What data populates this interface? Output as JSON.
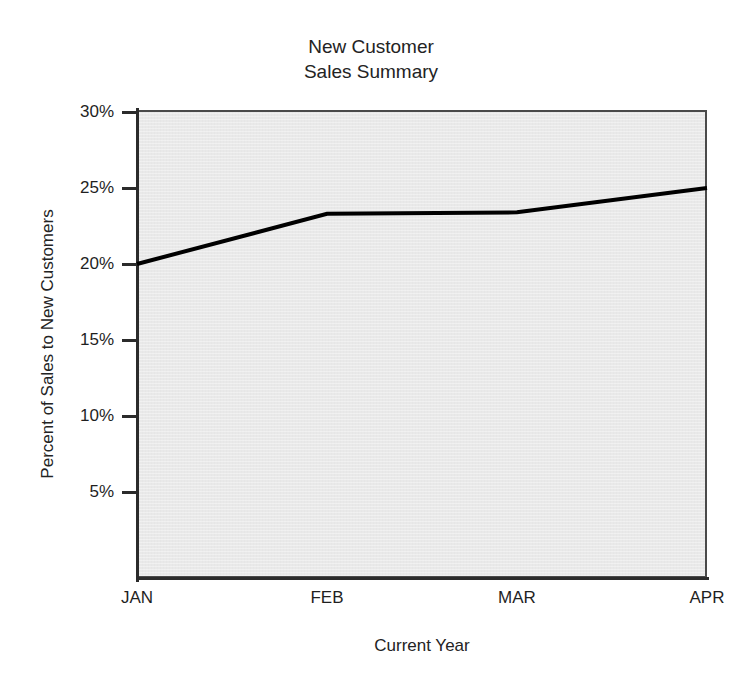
{
  "chart_data": {
    "type": "line",
    "title": "New Customer\nSales Summary",
    "title_lines": [
      "New Customer",
      "Sales Summary"
    ],
    "xlabel": "Current Year",
    "ylabel": "Percent of Sales to New Customers",
    "categories": [
      "JAN",
      "FEB",
      "MAR",
      "APR"
    ],
    "series": [
      {
        "name": "Percent of Sales to New Customers",
        "values": [
          20.0,
          23.3,
          23.4,
          25.0
        ],
        "color": "#000000",
        "line_width": 4
      }
    ],
    "ylim": [
      0,
      30
    ],
    "ytick_values": [
      30,
      25,
      20,
      15,
      10,
      5
    ],
    "ytick_labels": [
      "30%",
      "25%",
      "20%",
      "15%",
      "10%",
      "5%"
    ],
    "xtick_labels": [
      "JAN",
      "FEB",
      "MAR",
      "APR"
    ],
    "grid": false,
    "legend": false,
    "plot_background": "#e9e9e9",
    "axis_color": "#2b2b2b"
  }
}
